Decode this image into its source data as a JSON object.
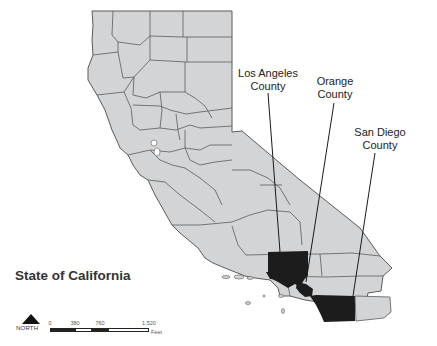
{
  "map": {
    "title": "State of California",
    "colors": {
      "state_fill": "#d3d4d6",
      "county_border": "#5a5a5a",
      "highlight_fill": "#1c1c1c",
      "background": "#ffffff",
      "leader_line": "#1a1a1a"
    },
    "highlighted_counties": [
      {
        "name": "Los Angeles",
        "label_line1": "Los Angeles",
        "label_line2": "County"
      },
      {
        "name": "Orange",
        "label_line1": "Orange",
        "label_line2": "County"
      },
      {
        "name": "San Diego",
        "label_line1": "San Diego",
        "label_line2": "County"
      }
    ],
    "north_arrow": {
      "label": "NORTH"
    },
    "scale_bar": {
      "ticks": [
        "0",
        "380",
        "760",
        "1,520"
      ],
      "unit": "Feet"
    }
  }
}
